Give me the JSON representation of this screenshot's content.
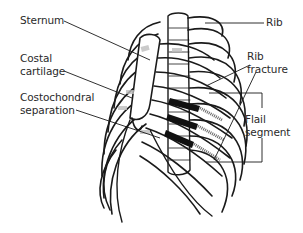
{
  "diagram": {
    "labels": {
      "sternum": "Sternum",
      "costal_cartilage_line1": "Costal",
      "costal_cartilage_line2": "cartilage",
      "costochondral_line1": "Costochondral",
      "costochondral_line2": "separation",
      "rib": "Rib",
      "rib_fracture_line1": "Rib",
      "rib_fracture_line2": "fracture",
      "flail_line1": "Flail",
      "flail_line2": "segment"
    },
    "colors": {
      "line": "#1a1a1a",
      "fracture_shading": "#111111",
      "cartilage": "#bdbdbd"
    }
  }
}
